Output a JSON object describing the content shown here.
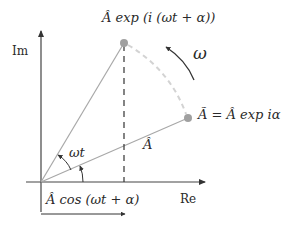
{
  "diagram": {
    "type": "phasor-diagram",
    "axes": {
      "imaginary_label": "Im",
      "real_label": "Re"
    },
    "labels": {
      "rotated_phasor": "Â exp (i (ωt + α))",
      "initial_phasor": "Ã = Â exp iα",
      "magnitude": "Â",
      "angular_velocity": "ω",
      "angle_rotation": "ωt",
      "angle_initial": "α",
      "projection": "Â cos (ωt + α)"
    },
    "colors": {
      "axis": "#333333",
      "phasor_line": "#a8a8a8",
      "point": "#a0a0a0",
      "dashed_arc": "#d0d0d0",
      "dashed_projection": "#333333",
      "text": "#2a2a2a"
    },
    "geometry": {
      "origin": [
        41,
        182
      ],
      "rotated_point": [
        124,
        43
      ],
      "initial_point": [
        188,
        118
      ],
      "im_axis_top": [
        41,
        28
      ],
      "re_axis_end": [
        207,
        182
      ]
    }
  }
}
